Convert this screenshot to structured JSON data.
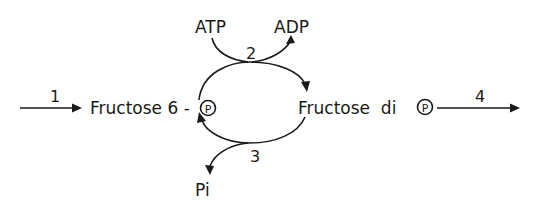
{
  "diagram": {
    "type": "metabolic-cycle",
    "nodes": {
      "substrate": "Fructose 6 -",
      "substrate_phosphate": "P",
      "product": "Fructose  di",
      "product_phosphate": "P"
    },
    "cofactors": {
      "atp": "ATP",
      "adp": "ADP",
      "pi": "Pi"
    },
    "steps": {
      "step1": "1",
      "step2": "2",
      "step3": "3",
      "step4": "4"
    },
    "edges": [
      {
        "from": "input",
        "to": "Fructose 6-P",
        "label": "1"
      },
      {
        "from": "Fructose 6-P",
        "to": "Fructose di P",
        "label": "2",
        "consumes": "ATP",
        "produces": "ADP"
      },
      {
        "from": "Fructose di P",
        "to": "Fructose 6-P",
        "label": "3",
        "produces": "Pi"
      },
      {
        "from": "Fructose di P",
        "to": "output",
        "label": "4"
      }
    ],
    "colors": {
      "ink": "#1a1a1a",
      "background": "#ffffff"
    }
  }
}
